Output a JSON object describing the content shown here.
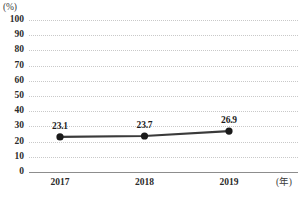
{
  "chart_data": {
    "type": "line",
    "title": "",
    "subtitle": "",
    "xlabel": "(年)",
    "ylabel": "(%)",
    "categories": [
      "2017",
      "2018",
      "2019"
    ],
    "values": [
      23.1,
      23.7,
      26.9
    ],
    "point_labels": [
      "23.1",
      "23.7",
      "26.9"
    ],
    "series": [
      {
        "name": "",
        "values": [
          23.1,
          23.7,
          26.9
        ]
      }
    ],
    "ylim": [
      0,
      100
    ],
    "y_ticks": [
      100,
      90,
      80,
      70,
      60,
      50,
      40,
      30,
      20,
      10,
      0
    ],
    "y_tick_labels": [
      "100",
      "90",
      "80",
      "70",
      "60",
      "50",
      "40",
      "30",
      "20",
      "10",
      "0"
    ],
    "x_tick_labels": [
      "2017",
      "2018",
      "2019"
    ],
    "grid": "horizontal-dotted",
    "legend": "none",
    "marker": "filled-circle",
    "colors": {
      "line": "#3a3a3a",
      "marker": "#1a1a1a",
      "gridline": "#c9c9c9",
      "axis": "#8d8d8d",
      "text": "#2b2b2b",
      "background": "#ffffff"
    }
  },
  "axes": {
    "y_unit": "(%)",
    "x_unit": "(年)"
  }
}
